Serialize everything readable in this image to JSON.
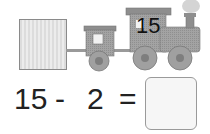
{
  "picture": {
    "engine_number": "15",
    "left_box": "blank box (unknown wagon)",
    "colors": {
      "train": "#9a9a9a",
      "box": "#e2e2e2",
      "text": "#222222"
    }
  },
  "equation": {
    "operand1": "15",
    "operator": "-",
    "operand2": "2",
    "equals": "=",
    "answer": ""
  }
}
